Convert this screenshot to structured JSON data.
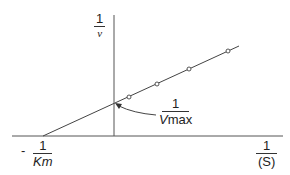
{
  "diagram": {
    "y_axis_label": {
      "numerator": "1",
      "denominator": "v"
    },
    "x_axis_label": {
      "numerator": "1",
      "denominator": "(S)"
    },
    "x_intercept_label": {
      "sign": "-",
      "numerator": "1",
      "denominator": "Km"
    },
    "y_intercept_label": {
      "numerator": "1",
      "denominator_main": "V",
      "denominator_sub": "max"
    },
    "line_color": "#444444",
    "data_points": [
      {
        "x": 129,
        "y": 97
      },
      {
        "x": 157,
        "y": 84
      },
      {
        "x": 189,
        "y": 69
      },
      {
        "x": 228,
        "y": 51
      }
    ]
  }
}
